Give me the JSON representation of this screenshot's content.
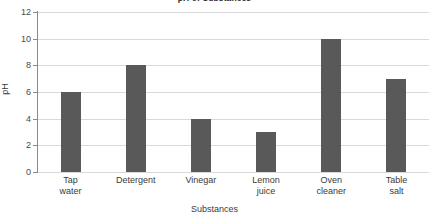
{
  "chart_data": {
    "type": "bar",
    "title": "pH of Substances",
    "xlabel": "Substances",
    "ylabel": "pH",
    "categories": [
      "Tap water",
      "Detergent",
      "Vinegar",
      "Lemon juice",
      "Oven cleaner",
      "Table salt"
    ],
    "category_lines": [
      [
        "Tap",
        "water"
      ],
      [
        "Detergent",
        ""
      ],
      [
        "Vinegar",
        ""
      ],
      [
        "Lemon",
        "juice"
      ],
      [
        "Oven",
        "cleaner"
      ],
      [
        "Table",
        "salt"
      ]
    ],
    "values": [
      6,
      8,
      4,
      3,
      10,
      7
    ],
    "ylim": [
      0,
      12
    ],
    "y_ticks": [
      12,
      10,
      8,
      6,
      4,
      2,
      0
    ],
    "grid": true,
    "legend": "none",
    "bar_color": "#595959",
    "gridline_color": "#d9d9d9",
    "axis_color": "#8a8a8a"
  }
}
